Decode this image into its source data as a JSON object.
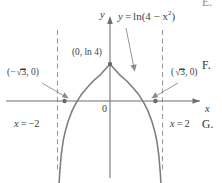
{
  "figure": {
    "kind": "cartesian-graph",
    "ink_color": "#3d3d3d",
    "axis_color": "#6f6f6f",
    "curve_color": "#7d7d7d",
    "asymptote_color": "#9a9a9a",
    "background": "#ffffff",
    "axes": {
      "x_label": "x",
      "y_label": "y",
      "origin_label": "0",
      "x_axis_y_px": 101,
      "y_axis_x_px": 110
    },
    "curve": {
      "equation_label_parts": {
        "lhs": "y",
        "equals": "=",
        "fn": "ln(4 − x",
        "exponent": "2",
        "close": ")"
      },
      "equation_plain": "y = ln(4 − x²)",
      "domain": [
        -2,
        2
      ],
      "peak_value": "ln 4"
    },
    "asymptotes": [
      {
        "label_parts": {
          "var": "x",
          "eq": "=",
          "val": "−2"
        },
        "plain": "x = −2",
        "x_value": -2,
        "x_px": 60,
        "dashed": true
      },
      {
        "label_parts": {
          "var": "x",
          "eq": "=",
          "val": "2"
        },
        "plain": "x = 2",
        "x_value": 2,
        "x_px": 165,
        "dashed": true
      }
    ],
    "points": [
      {
        "name": "peak",
        "label_plain": "(0, ln 4)",
        "label_parts": {
          "open": "(0, ln 4)"
        },
        "x_px": 110,
        "y_px": 64
      },
      {
        "name": "left-root",
        "label_plain": "(−√3, 0)",
        "label_parts": {
          "open": "(",
          "sign": "−",
          "radicand": "3",
          "rest": ", 0)"
        },
        "x_px": 63,
        "y_px": 101
      },
      {
        "name": "right-root",
        "label_plain": "(√3, 0)",
        "label_parts": {
          "open": "(",
          "sign": "",
          "radicand": "3",
          "rest": ", 0)"
        },
        "x_px": 162,
        "y_px": 101
      }
    ]
  },
  "margin_markers": [
    {
      "id": "E",
      "label": "E."
    },
    {
      "id": "F",
      "label": "F."
    },
    {
      "id": "G",
      "label": "G."
    }
  ],
  "chart_data": {
    "type": "line",
    "title": "",
    "xlabel": "x",
    "ylabel": "y",
    "equation": "y = ln(4 - x^2)",
    "xlim": [
      -2.6,
      2.6
    ],
    "ylim": [
      -4.2,
      1.8
    ],
    "grid": false,
    "legend": null,
    "vertical_asymptotes": [
      -2,
      2
    ],
    "x_intercepts": [
      -1.7320508,
      1.7320508
    ],
    "y_intercept": 1.3862944,
    "annotations": [
      {
        "text": "y = ln(4 - x^2)",
        "x": 0.95,
        "y": 1.62
      },
      {
        "text": "(0, ln 4)",
        "x": -0.42,
        "y": 1.62
      },
      {
        "text": "(-√3, 0)",
        "x": -2.28,
        "y": 0.8
      },
      {
        "text": "(√3, 0)",
        "x": 1.82,
        "y": 0.8
      },
      {
        "text": "x = -2",
        "x": -2.18,
        "y": -1.1
      },
      {
        "text": "x = 2",
        "x": 1.58,
        "y": -1.1
      }
    ],
    "series": [
      {
        "name": "y = ln(4 - x^2)",
        "x": [
          -1.995,
          -1.98,
          -1.96,
          -1.92,
          -1.86,
          -1.78,
          -1.7,
          -1.6,
          -1.45,
          -1.3,
          -1.1,
          -0.9,
          -0.65,
          -0.35,
          0.0,
          0.35,
          0.65,
          0.9,
          1.1,
          1.3,
          1.45,
          1.6,
          1.7,
          1.78,
          1.86,
          1.92,
          1.96,
          1.98,
          1.995
        ],
        "y": [
          -4.83,
          -4.14,
          -3.44,
          -2.74,
          -2.04,
          -1.47,
          -1.12,
          -0.78,
          -0.38,
          -0.09,
          0.23,
          0.47,
          0.74,
          1.0,
          1.386,
          1.0,
          0.74,
          0.47,
          0.23,
          -0.09,
          -0.38,
          -0.78,
          -1.12,
          -1.47,
          -2.04,
          -2.74,
          -3.44,
          -4.14,
          -4.83
        ]
      }
    ]
  }
}
